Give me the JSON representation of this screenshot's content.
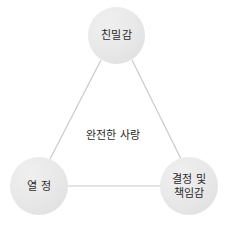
{
  "diagram": {
    "title": "완전한 사랑",
    "center_label": "완전한 사랑",
    "background_color": "#ffffff",
    "node_fill_color": "#e8e8e8",
    "edge_color": "#c9c9c9",
    "text_color": "#2b2b2b",
    "nodes": [
      {
        "id": "intimacy",
        "label": "친밀감",
        "position": "top"
      },
      {
        "id": "passion",
        "label": "열 정",
        "position": "bottom-left"
      },
      {
        "id": "commitment",
        "label": "결정 및\n책임감",
        "position": "bottom-right"
      }
    ],
    "edges": [
      {
        "from": "intimacy",
        "to": "passion"
      },
      {
        "from": "intimacy",
        "to": "commitment"
      },
      {
        "from": "passion",
        "to": "commitment"
      }
    ]
  }
}
